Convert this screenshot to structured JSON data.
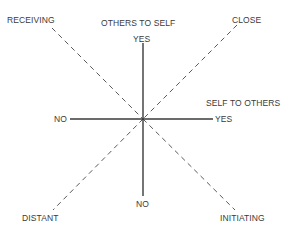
{
  "diagram": {
    "center": {
      "x": 143,
      "y": 119
    },
    "colors": {
      "line": "#3a3a3a",
      "dashed": "#5a5a5a",
      "text": "#3a3a3a",
      "background": "#ffffff"
    },
    "axes": {
      "vertical": {
        "title": "OTHERS TO SELF",
        "positive_label": "YES",
        "negative_label": "NO"
      },
      "horizontal": {
        "title": "SELF TO OTHERS",
        "positive_label": "YES",
        "negative_label": "NO"
      }
    },
    "diagonals": {
      "top_left": "RECEIVING",
      "top_right": "CLOSE",
      "bottom_left": "DISTANT",
      "bottom_right": "INITIATING"
    }
  }
}
